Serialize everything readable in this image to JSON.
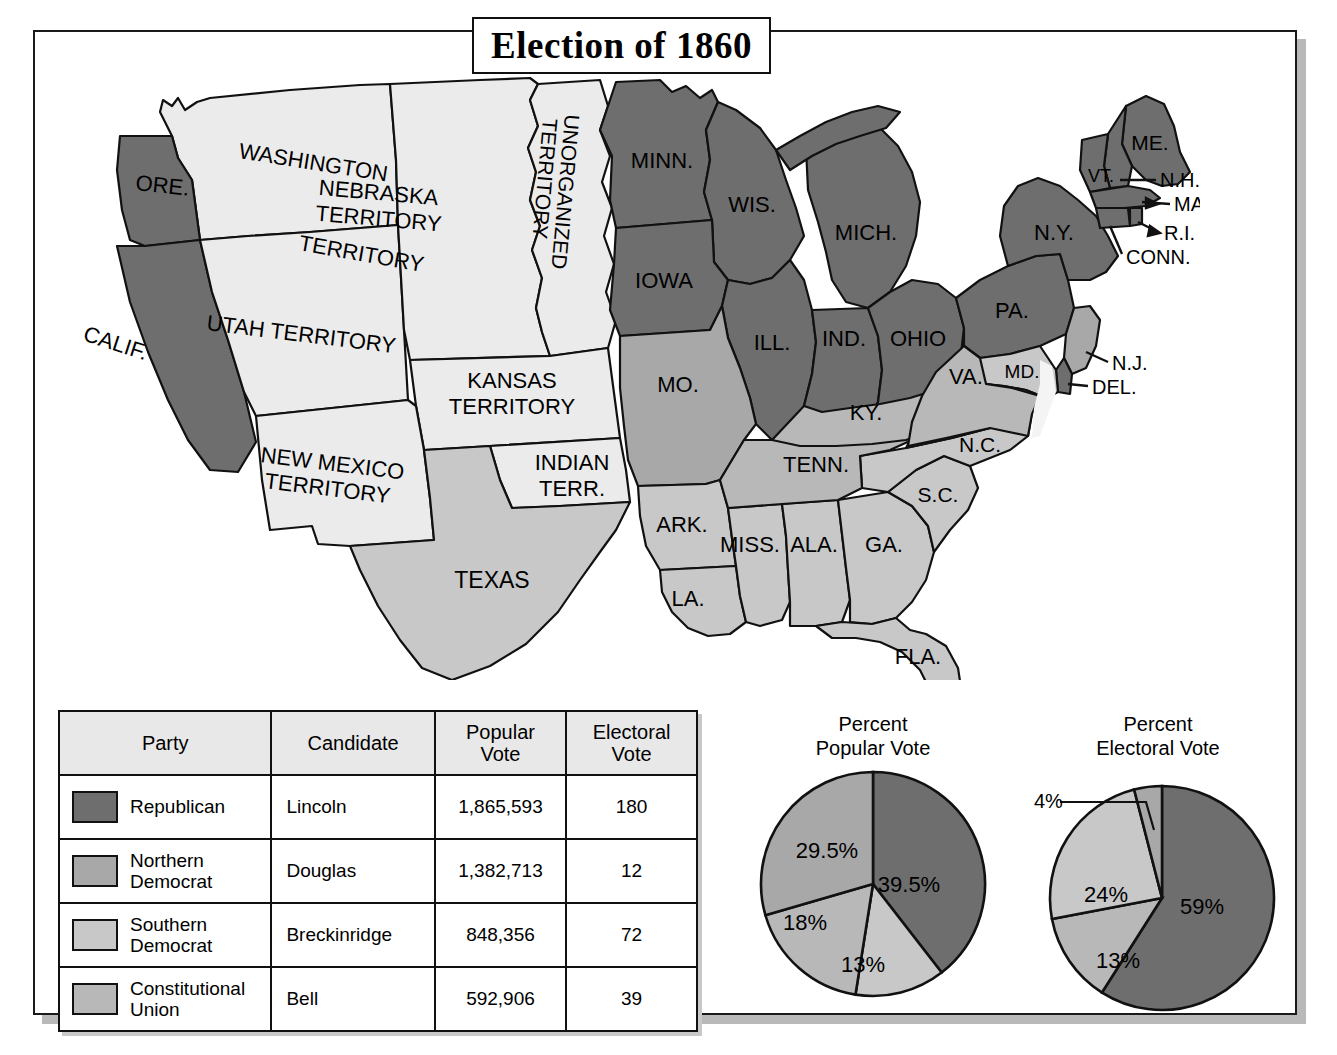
{
  "title": "Election of 1860",
  "colors": {
    "republican": "#6e6e6e",
    "northern_democrat": "#a8a8a8",
    "southern_democrat": "#c8c8c8",
    "constitutional_union": "#b8b8b8",
    "territory": "#ebebeb",
    "unshaded": "#f2f2f2",
    "outline": "#111111",
    "header_bg": "#e8e8e8"
  },
  "table": {
    "headers": [
      "Party",
      "Candidate",
      "Popular\nVote",
      "Electoral\nVote"
    ],
    "rows": [
      {
        "party": "Republican",
        "candidate": "Lincoln",
        "popular_vote": "1,865,593",
        "electoral_vote": "180",
        "swatch": "#6e6e6e"
      },
      {
        "party": "Northern\nDemocrat",
        "candidate": "Douglas",
        "popular_vote": "1,382,713",
        "electoral_vote": "12",
        "swatch": "#a8a8a8"
      },
      {
        "party": "Southern\nDemocrat",
        "candidate": "Breckinridge",
        "popular_vote": "848,356",
        "electoral_vote": "72",
        "swatch": "#c8c8c8"
      },
      {
        "party": "Constitutional\nUnion",
        "candidate": "Bell",
        "popular_vote": "592,906",
        "electoral_vote": "39",
        "swatch": "#b8b8b8"
      }
    ]
  },
  "chart_data": [
    {
      "type": "pie",
      "title": "Percent\nPopular Vote",
      "categories": [
        "Republican",
        "Southern Democrat",
        "Constitutional Union",
        "Northern Democrat"
      ],
      "labels": [
        "39.5%",
        "13%",
        "18%",
        "29.5%"
      ],
      "values": [
        39.5,
        13,
        18,
        29.5
      ],
      "colors": [
        "#6e6e6e",
        "#c8c8c8",
        "#b8b8b8",
        "#a8a8a8"
      ],
      "legend": "none"
    },
    {
      "type": "pie",
      "title": "Percent\nElectoral Vote",
      "categories": [
        "Republican",
        "Constitutional Union",
        "Southern Democrat",
        "Northern Democrat"
      ],
      "labels": [
        "59%",
        "13%",
        "24%",
        "4%"
      ],
      "values": [
        59,
        13,
        24,
        4
      ],
      "colors": [
        "#6e6e6e",
        "#b8b8b8",
        "#c8c8c8",
        "#a8a8a8"
      ],
      "legend": "none",
      "callout": "4%"
    }
  ],
  "map": {
    "states": [
      {
        "name": "WASHINGTON",
        "label": "WASHINGTON",
        "fill": "#ebebeb"
      },
      {
        "name": "TERRITORY",
        "label": "TERRITORY",
        "fill": "#ebebeb"
      },
      {
        "name": "ORE.",
        "label": "ORE.",
        "fill": "#6e6e6e"
      },
      {
        "name": "CALIF.",
        "label": "CALIF.",
        "fill": "#6e6e6e"
      },
      {
        "name": "UTAH TERRITORY",
        "label": "UTAH TERRITORY",
        "fill": "#ebebeb"
      },
      {
        "name": "NEBRASKA TERRITORY",
        "label": "NEBRASKA\nTERRITORY",
        "fill": "#ebebeb"
      },
      {
        "name": "UNORGANIZED TERRITORY",
        "label": "UNORGANIZED\nTERRITORY",
        "fill": "#ebebeb"
      },
      {
        "name": "KANSAS TERRITORY",
        "label": "KANSAS\nTERRITORY",
        "fill": "#ebebeb"
      },
      {
        "name": "NEW MEXICO TERRITORY",
        "label": "NEW  MEXICO\nTERRITORY",
        "fill": "#ebebeb"
      },
      {
        "name": "INDIAN TERR.",
        "label": "INDIAN\nTERR.",
        "fill": "#ebebeb"
      },
      {
        "name": "MINN.",
        "label": "MINN.",
        "fill": "#6e6e6e"
      },
      {
        "name": "WIS.",
        "label": "WIS.",
        "fill": "#6e6e6e"
      },
      {
        "name": "IOWA",
        "label": "IOWA",
        "fill": "#6e6e6e"
      },
      {
        "name": "MICH.",
        "label": "MICH.",
        "fill": "#6e6e6e"
      },
      {
        "name": "ILL.",
        "label": "ILL.",
        "fill": "#6e6e6e"
      },
      {
        "name": "IND.",
        "label": "IND.",
        "fill": "#6e6e6e"
      },
      {
        "name": "OHIO",
        "label": "OHIO",
        "fill": "#6e6e6e"
      },
      {
        "name": "PA.",
        "label": "PA.",
        "fill": "#6e6e6e"
      },
      {
        "name": "N.Y.",
        "label": "N.Y.",
        "fill": "#6e6e6e"
      },
      {
        "name": "ME.",
        "label": "ME.",
        "fill": "#6e6e6e"
      },
      {
        "name": "VT.",
        "label": "VT.",
        "fill": "#6e6e6e"
      },
      {
        "name": "N.H.",
        "label": "N.H.",
        "fill": "#6e6e6e"
      },
      {
        "name": "MASS.",
        "label": "MASS.",
        "fill": "#6e6e6e"
      },
      {
        "name": "R.I.",
        "label": "R.I.",
        "fill": "#6e6e6e"
      },
      {
        "name": "CONN.",
        "label": "CONN.",
        "fill": "#6e6e6e"
      },
      {
        "name": "N.J.",
        "label": "N.J.",
        "fill": "#a8a8a8"
      },
      {
        "name": "DEL.",
        "label": "DEL.",
        "fill": "#6e6e6e"
      },
      {
        "name": "MD.",
        "label": "MD.",
        "fill": "#c8c8c8"
      },
      {
        "name": "MO.",
        "label": "MO.",
        "fill": "#a8a8a8"
      },
      {
        "name": "VA.",
        "label": "VA.",
        "fill": "#b8b8b8"
      },
      {
        "name": "KY.",
        "label": "KY.",
        "fill": "#b8b8b8"
      },
      {
        "name": "TENN.",
        "label": "TENN.",
        "fill": "#b8b8b8"
      },
      {
        "name": "N.C.",
        "label": "N.C.",
        "fill": "#c8c8c8"
      },
      {
        "name": "S.C.",
        "label": "S.C.",
        "fill": "#c8c8c8"
      },
      {
        "name": "GA.",
        "label": "GA.",
        "fill": "#c8c8c8"
      },
      {
        "name": "FLA.",
        "label": "FLA.",
        "fill": "#c8c8c8"
      },
      {
        "name": "ALA.",
        "label": "ALA.",
        "fill": "#c8c8c8"
      },
      {
        "name": "MISS.",
        "label": "MISS.",
        "fill": "#c8c8c8"
      },
      {
        "name": "ARK.",
        "label": "ARK.",
        "fill": "#c8c8c8"
      },
      {
        "name": "LA.",
        "label": "LA.",
        "fill": "#c8c8c8"
      },
      {
        "name": "TEXAS",
        "label": "TEXAS",
        "fill": "#c8c8c8"
      }
    ]
  }
}
